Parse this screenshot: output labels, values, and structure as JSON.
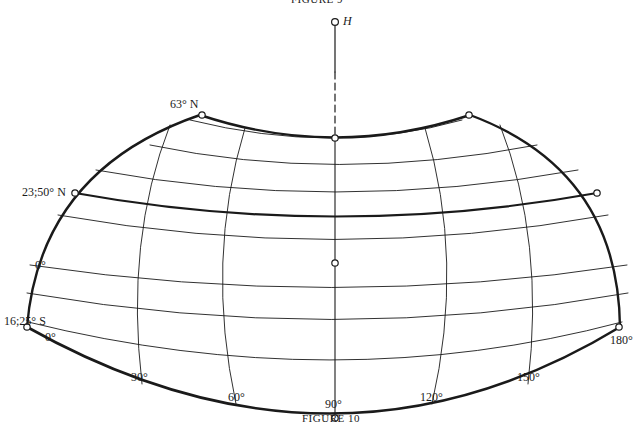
{
  "captions": {
    "top": "FIGURE 9",
    "bottom": "FIGURE 10"
  },
  "pole_label": "H",
  "latitude_labels": {
    "north_limit": "63° N",
    "tropic": "23;50° N",
    "equator": "0°",
    "south_limit": "16;25° S"
  },
  "longitude_labels": [
    "0°",
    "30°",
    "60°",
    "90°",
    "120°",
    "150°",
    "180°"
  ],
  "colors": {
    "ink": "#1a1a1a",
    "background": "#ffffff"
  }
}
